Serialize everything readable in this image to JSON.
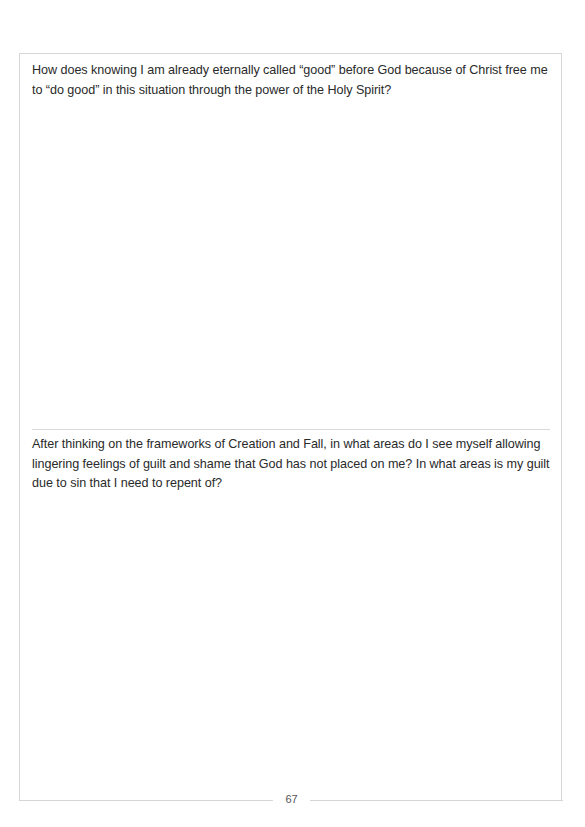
{
  "page": {
    "prompts": [
      {
        "text": "How does knowing I am already eternally called “good” before God because of Christ free me to “do good” in this situation through the power of the Holy Spirit?"
      },
      {
        "text": "After thinking on the frameworks of Creation and Fall, in what areas do I see myself allowing lingering feelings of guilt and shame that God has not placed on me? In what areas is my guilt due to sin that I need to repent of?"
      }
    ],
    "page_number": "67"
  }
}
